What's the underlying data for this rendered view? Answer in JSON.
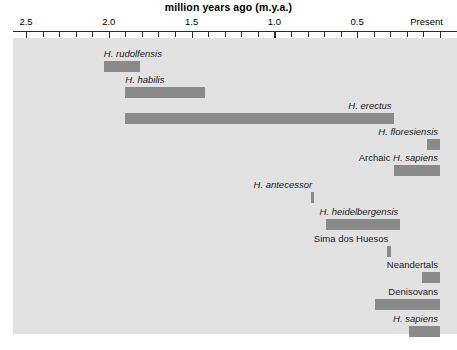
{
  "chart_data": {
    "type": "bar",
    "title": "million years ago (m.y.a.)",
    "xlabel": "million years ago (m.y.a.)",
    "ylabel": "",
    "orientation": "horizontal-ranges",
    "axis": {
      "direction": "reversed",
      "min": 0.0,
      "max": 2.5,
      "tick_interval": 0.1,
      "major_tick_interval": 0.5,
      "tick_labels": [
        {
          "value": 2.5,
          "text": "2.5"
        },
        {
          "value": 2.0,
          "text": "2.0"
        },
        {
          "value": 1.5,
          "text": "1.5"
        },
        {
          "value": 1.0,
          "text": "1.0"
        },
        {
          "value": 0.5,
          "text": "0.5"
        },
        {
          "value": 0.0,
          "text": "Present"
        }
      ],
      "tick_values": [
        2.5,
        2.4,
        2.3,
        2.2,
        2.1,
        2.0,
        1.9,
        1.8,
        1.7,
        1.6,
        1.5,
        1.4,
        1.3,
        1.2,
        1.1,
        1.0,
        0.9,
        0.8,
        0.7,
        0.6,
        0.5,
        0.4,
        0.3,
        0.2,
        0.1,
        0.0
      ]
    },
    "grid": false,
    "legend_position": "none",
    "plot_background": "#e2e2e2",
    "bar_color": "#8a8a8a",
    "categories": [
      "H. rudolfensis",
      "H. habilis",
      "H. erectus",
      "H. floresiensis",
      "Archaic H. sapiens",
      "H. antecessor",
      "H. heidelbergensis",
      "Sima dos Huesos",
      "Neandertals",
      "Denisovans",
      "H. sapiens"
    ],
    "ranges": [
      {
        "label": "H. rudolfensis",
        "label_style": "italic",
        "start_mya": 2.03,
        "end_mya": 1.81,
        "label_align": "left"
      },
      {
        "label": "H. habilis",
        "label_style": "italic",
        "start_mya": 1.9,
        "end_mya": 1.42,
        "label_align": "left"
      },
      {
        "label": "H. erectus",
        "label_style": "italic",
        "start_mya": 1.9,
        "end_mya": 0.28,
        "label_align": "right"
      },
      {
        "label": "H. floresiensis",
        "label_style": "italic",
        "start_mya": 0.08,
        "end_mya": 0.0,
        "label_align": "right"
      },
      {
        "label": "Archaic H. sapiens",
        "label_style": "mixed",
        "label_plain": "Archaic ",
        "label_italic": "H. sapiens",
        "start_mya": 0.28,
        "end_mya": 0.0,
        "label_align": "right"
      },
      {
        "label": "H. antecessor",
        "label_style": "italic",
        "start_mya": 0.78,
        "end_mya": 0.76,
        "label_align": "right"
      },
      {
        "label": "H. heidelbergensis",
        "label_style": "italic",
        "start_mya": 0.69,
        "end_mya": 0.24,
        "label_align": "right"
      },
      {
        "label": "Sima dos Huesos",
        "label_style": "upright",
        "start_mya": 0.32,
        "end_mya": 0.3,
        "label_align": "right"
      },
      {
        "label": "Neandertals",
        "label_style": "upright",
        "start_mya": 0.11,
        "end_mya": 0.0,
        "label_align": "right"
      },
      {
        "label": "Denisovans",
        "label_style": "upright",
        "start_mya": 0.39,
        "end_mya": 0.0,
        "label_align": "right"
      },
      {
        "label": "H. sapiens",
        "label_style": "italic",
        "start_mya": 0.19,
        "end_mya": 0.0,
        "label_align": "right"
      }
    ]
  }
}
